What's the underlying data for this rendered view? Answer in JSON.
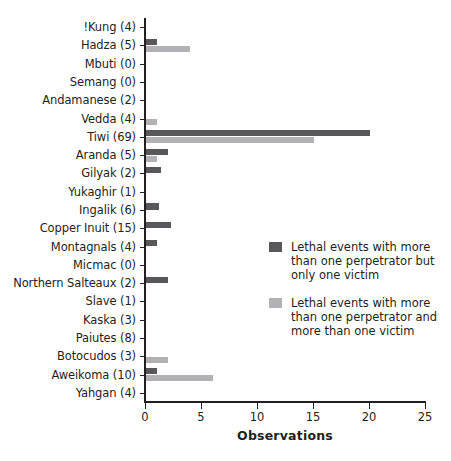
{
  "chart_data": {
    "type": "bar",
    "orientation": "horizontal",
    "title": "",
    "xlabel": "Observations",
    "ylabel": "",
    "xlim": [
      0,
      25
    ],
    "xticks": [
      0,
      5,
      10,
      15,
      20,
      25
    ],
    "grid": false,
    "legend_position": "middle-right",
    "categories": [
      "!Kung (4)",
      "Hadza (5)",
      "Mbuti (0)",
      "Semang (0)",
      "Andamanese (2)",
      "Vedda (4)",
      "Tiwi (69)",
      "Aranda (5)",
      "Gilyak (2)",
      "Yukaghir (1)",
      "Ingalik (6)",
      "Copper Inuit (15)",
      "Montagnals (4)",
      "Micmac (0)",
      "Northern Salteaux (2)",
      "Slave (1)",
      "Kaska (3)",
      "Paiutes (8)",
      "Botocudos (3)",
      "Aweikoma (10)",
      "Yahgan (4)"
    ],
    "series": [
      {
        "name": "Lethal events with more than one perpetrator but only one victim",
        "color": "#58585b",
        "values": [
          0,
          1.0,
          0,
          0,
          0,
          0,
          20.0,
          2.0,
          1.3,
          0,
          1.2,
          2.2,
          1.0,
          0,
          2.0,
          0,
          0,
          0,
          0,
          1.0,
          0
        ]
      },
      {
        "name": "Lethal events with more than one perpetrator and more than one victim",
        "color": "#b2b2b4",
        "values": [
          0,
          3.9,
          0,
          0,
          0,
          1.0,
          15.0,
          1.0,
          0,
          0,
          0,
          0,
          0,
          0,
          0,
          0,
          0,
          0,
          2.0,
          6.0,
          0
        ]
      }
    ]
  },
  "legend": {
    "items": [
      {
        "label": "Lethal events with more than one perpetrator but only one victim",
        "color": "#58585b"
      },
      {
        "label": "Lethal events with more than one perpetrator and more than one victim",
        "color": "#b2b2b4"
      }
    ]
  },
  "axis": {
    "x_title": "Observations"
  }
}
